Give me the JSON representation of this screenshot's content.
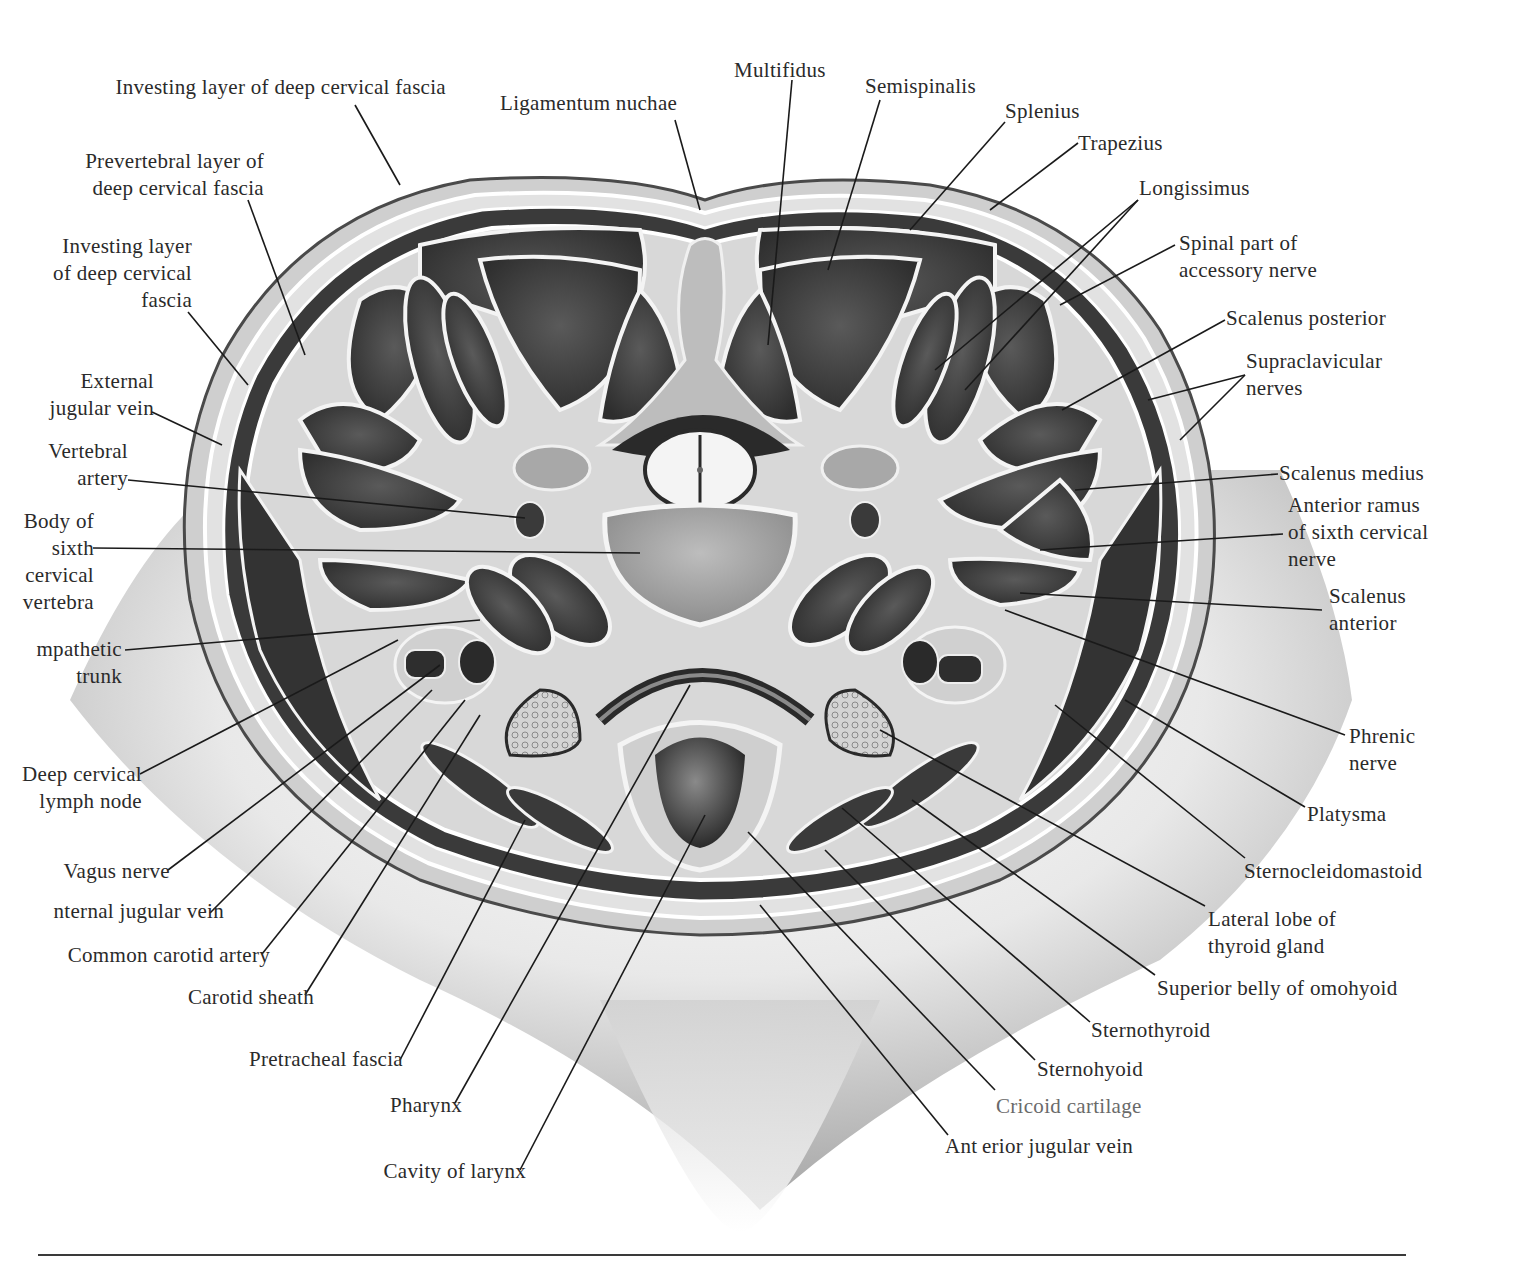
{
  "figure": {
    "type": "anatomical cross-section",
    "colors": {
      "background": "#ffffff",
      "ink": "#2a2a2a",
      "muscle": "#3d3d3d",
      "fascia": "#d9d9d9",
      "skin_shadow": "#9a9a9a"
    }
  },
  "labels": {
    "left": [
      {
        "id": "investing-layer-top",
        "text": "Investing layer of deep cervical fascia"
      },
      {
        "id": "prevertebral-layer",
        "lines": [
          "Prevertebral layer of",
          "deep cervical fascia"
        ]
      },
      {
        "id": "investing-layer-side",
        "lines": [
          "Investing layer",
          "of deep cervical",
          "fascia"
        ]
      },
      {
        "id": "external-jugular-vein",
        "lines": [
          "External",
          "jugular vein"
        ]
      },
      {
        "id": "vertebral-artery",
        "lines": [
          "Vertebral",
          "artery"
        ]
      },
      {
        "id": "body-sixth-cervical-vertebra",
        "lines": [
          "Body of",
          "sixth",
          "cervical",
          "vertebra"
        ]
      },
      {
        "id": "sympathetic-trunk",
        "lines": [
          "mpathetic",
          "trunk"
        ]
      },
      {
        "id": "deep-cervical-lymph-node",
        "lines": [
          "Deep cervical",
          "lymph node"
        ]
      },
      {
        "id": "vagus-nerve",
        "text": "Vagus nerve"
      },
      {
        "id": "internal-jugular-vein",
        "text": "nternal jugular vein"
      },
      {
        "id": "common-carotid-artery",
        "text": "Common carotid artery"
      },
      {
        "id": "carotid-sheath",
        "text": "Carotid sheath"
      },
      {
        "id": "pretracheal-fascia",
        "text": "Pretracheal fascia"
      },
      {
        "id": "pharynx",
        "text": "Pharynx"
      },
      {
        "id": "cavity-of-larynx",
        "text": "Cavity of larynx"
      }
    ],
    "top": [
      {
        "id": "ligamentum-nuchae",
        "text": "Ligamentum nuchae"
      },
      {
        "id": "multifidus",
        "text": "Multifidus"
      },
      {
        "id": "semispinalis",
        "text": "Semispinalis"
      }
    ],
    "right": [
      {
        "id": "splenius",
        "text": "Splenius"
      },
      {
        "id": "trapezius",
        "text": "Trapezius"
      },
      {
        "id": "longissimus",
        "text": "Longissimus"
      },
      {
        "id": "spinal-accessory-nerve",
        "lines": [
          "Spinal part of",
          "accessory nerve"
        ]
      },
      {
        "id": "scalenus-posterior",
        "text": "Scalenus posterior"
      },
      {
        "id": "supraclavicular-nerves",
        "lines": [
          "Supraclavicular",
          "nerves"
        ]
      },
      {
        "id": "scalenus-medius",
        "text": "Scalenus medius"
      },
      {
        "id": "anterior-ramus-c6",
        "lines": [
          "Anterior ramus",
          "of sixth cervical",
          "nerve"
        ]
      },
      {
        "id": "scalenus-anterior",
        "lines": [
          "Scalenus",
          "anterior"
        ]
      },
      {
        "id": "phrenic-nerve",
        "lines": [
          "Phrenic",
          "nerve"
        ]
      },
      {
        "id": "platysma",
        "text": "Platysma"
      },
      {
        "id": "sternocleidomastoid",
        "text": "Sternocleidomastoid"
      },
      {
        "id": "thyroid-lateral-lobe",
        "lines": [
          "Lateral lobe of",
          "thyroid gland"
        ]
      },
      {
        "id": "omohyoid-superior-belly",
        "text": "Superior belly of omohyoid"
      },
      {
        "id": "sternothyroid",
        "text": "Sternothyroid"
      },
      {
        "id": "sternohyoid",
        "text": "Sternohyoid"
      },
      {
        "id": "cricoid-cartilage",
        "text": "Cricoid cartilage"
      },
      {
        "id": "anterior-jugular-vein",
        "text": "Ant\u0000rior jugular vein"
      }
    ]
  }
}
